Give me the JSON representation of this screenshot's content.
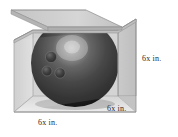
{
  "figure": {
    "type": "3d-geometry-illustration",
    "background_color": "#ffffff"
  },
  "labels": {
    "right_edge": "6x in.",
    "front_right_edge": "6x in.",
    "front_left_edge": "6x in."
  },
  "box": {
    "name": "open-cube-box",
    "face_colors": {
      "left_wall": "#d2d2d2",
      "back_wall": "#cfcfcf",
      "right_wall": "#c6c6c6",
      "floor": "#e3e3e3",
      "lid_flap": "#cdcdcd",
      "lid_top": "#d8d8d8"
    },
    "edge_color": "#8a8a8a"
  },
  "ball": {
    "name": "bowling-ball",
    "base_color": "#2a2a2a",
    "shadow_color": "#101010",
    "highlight_color": "#b9b9b9",
    "finger_holes": 3,
    "hole_color": "#1a1a1a"
  }
}
